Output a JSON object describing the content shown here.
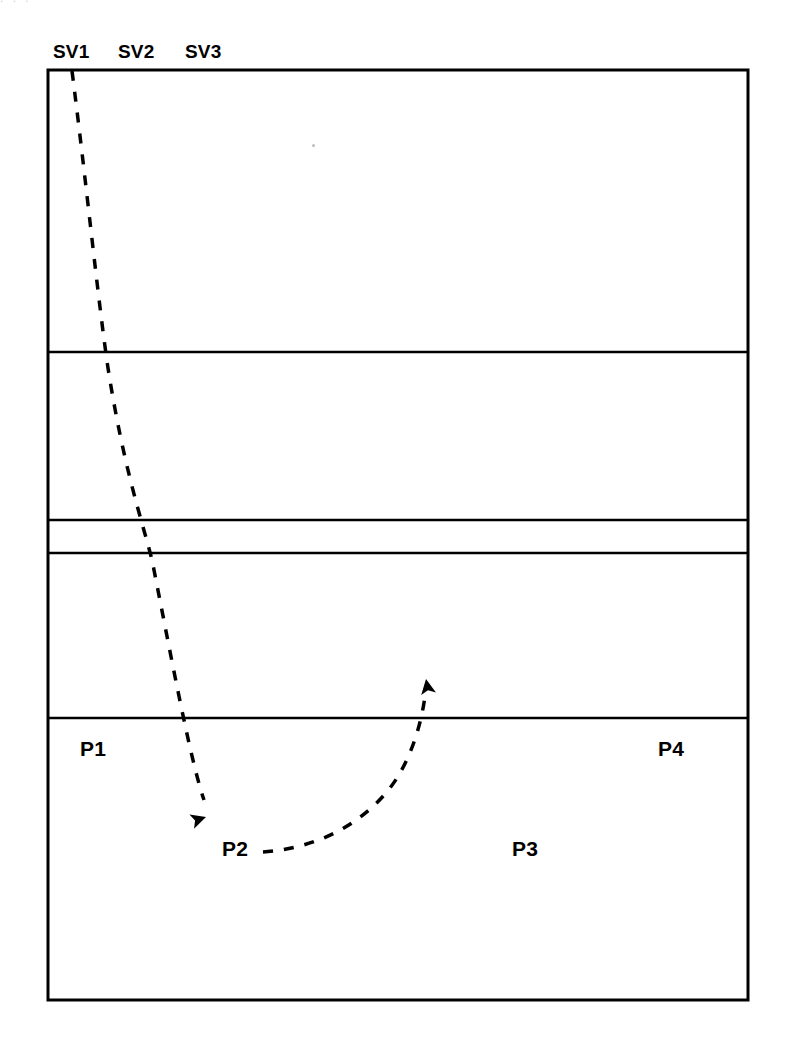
{
  "figure": {
    "type": "court-diagram",
    "background_color": "#ffffff",
    "line_color": "#000000",
    "text_color": "#000000"
  },
  "top_bleed_text": ". . .",
  "footer_note": "",
  "header_labels": [
    {
      "name": "sv1",
      "text": "SV1",
      "x": 53,
      "y": 42
    },
    {
      "name": "sv2",
      "text": "SV2",
      "x": 118,
      "y": 42
    },
    {
      "name": "sv3",
      "text": "SV3",
      "x": 185,
      "y": 42
    }
  ],
  "position_labels": [
    {
      "name": "p1",
      "text": "P1",
      "x": 80,
      "y": 738
    },
    {
      "name": "p2",
      "text": "P2",
      "x": 222,
      "y": 838
    },
    {
      "name": "p3",
      "text": "P3",
      "x": 512,
      "y": 838
    },
    {
      "name": "p4",
      "text": "P4",
      "x": 658,
      "y": 738
    }
  ],
  "court": {
    "outer": {
      "x": 48,
      "y": 70,
      "width": 700,
      "height": 930,
      "stroke_width": 3
    },
    "divider_lines": [
      {
        "name": "divider-1",
        "y": 352,
        "stroke_width": 2.5
      },
      {
        "name": "divider-2",
        "y": 520,
        "stroke_width": 2.5
      },
      {
        "name": "divider-3",
        "y": 553,
        "stroke_width": 2.5
      },
      {
        "name": "divider-4",
        "y": 718,
        "stroke_width": 2.5
      }
    ]
  },
  "paths": [
    {
      "name": "serve-path",
      "style": "dashed",
      "dash": "10 11",
      "stroke_width": 3.5,
      "d": "M 72 71 C 86 180, 98 300, 108 368 C 124 470, 142 520, 152 560 C 168 640, 190 760, 204 800",
      "arrow": {
        "name": "serve-arrowhead",
        "x": 206,
        "y": 817,
        "angle": 72
      }
    },
    {
      "name": "player-movement-path",
      "style": "dashed",
      "dash": "10 11",
      "stroke_width": 3.5,
      "d": "M 263 852 C 316 848, 360 826, 390 788 C 410 762, 421 726, 425 696",
      "arrow": {
        "name": "movement-arrowhead",
        "x": 426,
        "y": 679,
        "angle": -10
      }
    }
  ],
  "artifacts": [
    {
      "name": "scan-speck",
      "x": 312,
      "y": 144
    }
  ]
}
